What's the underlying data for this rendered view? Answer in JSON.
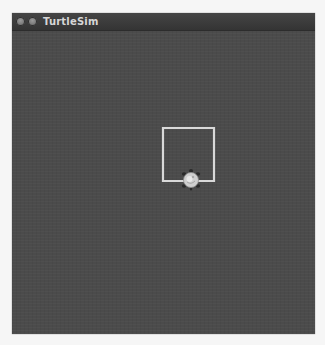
{
  "window": {
    "title": "TurtleSim",
    "buttons": [
      {
        "name": "close",
        "icon": "close-icon"
      },
      {
        "name": "minimize",
        "icon": "minimize-icon"
      }
    ]
  },
  "canvas": {
    "background_color": "#4b4b4b",
    "pen_color": "#d9d9d9",
    "path_shape": "square",
    "turtle": {
      "icon": "turtle-icon",
      "shell_color": "#cfcfcf",
      "limb_color": "#2a2a2a"
    }
  }
}
